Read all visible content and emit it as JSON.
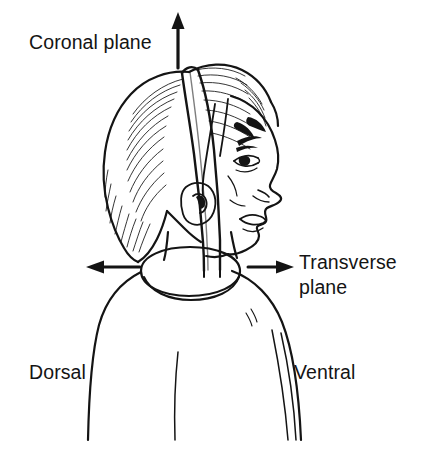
{
  "figure": {
    "background_color": "#ffffff",
    "ink_color": "#141414"
  },
  "labels": {
    "coronal_plane": "Coronal plane",
    "transverse_plane_line1": "Transverse",
    "transverse_plane_line2": "plane",
    "dorsal": "Dorsal",
    "ventral": "Ventral"
  },
  "arrows": [
    {
      "name": "coronal-plane-arrow",
      "direction": "up",
      "points_to": "Coronal plane",
      "x": 178,
      "y_start": 68,
      "y_end": 15
    },
    {
      "name": "transverse-plane-arrow-left",
      "direction": "left",
      "points_to": "Dorsal",
      "y": 267,
      "x_start": 140,
      "x_end": 88
    },
    {
      "name": "transverse-plane-arrow-right",
      "direction": "right",
      "points_to": "Transverse plane",
      "y": 267,
      "x_start": 248,
      "x_end": 292
    }
  ],
  "anatomy": {
    "planes": [
      {
        "name": "coronal-plane-band",
        "description": "vertical band passing over the top of the head from front to back, dividing dorsal from ventral"
      },
      {
        "name": "transverse-plane-ellipse",
        "description": "horizontal ellipse around the neck collar, dividing superior from inferior"
      }
    ],
    "features": [
      "hair",
      "ear",
      "eye",
      "eyebrow",
      "nose",
      "lips",
      "chin",
      "neck",
      "shoulders",
      "collar"
    ]
  }
}
